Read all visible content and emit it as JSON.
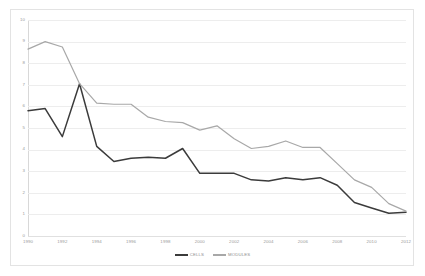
{
  "chart_data": {
    "type": "line",
    "title": "",
    "xlabel": "",
    "ylabel": "",
    "xlim": [
      1990,
      2012
    ],
    "ylim": [
      0,
      10
    ],
    "grid": true,
    "legend_position": "bottom-center",
    "x": [
      1990,
      1991,
      1992,
      1993,
      1994,
      1995,
      1996,
      1997,
      1998,
      1999,
      2000,
      2001,
      2002,
      2003,
      2004,
      2005,
      2006,
      2007,
      2008,
      2009,
      2010,
      2011,
      2012
    ],
    "xticks": [
      "1990",
      "1992",
      "1994",
      "1996",
      "1998",
      "2000",
      "2002",
      "2004",
      "2006",
      "2008",
      "2010",
      "2012"
    ],
    "yticks": [
      "10",
      "9",
      "8",
      "7",
      "6",
      "5",
      "4",
      "3",
      "2",
      "1",
      "0"
    ],
    "series": [
      {
        "name": "CELLS",
        "color": "#3b3b3b",
        "values": [
          5.8,
          5.9,
          4.6,
          7.05,
          4.15,
          3.45,
          3.6,
          3.65,
          3.6,
          4.05,
          2.9,
          2.9,
          2.9,
          2.6,
          2.55,
          2.7,
          2.6,
          2.7,
          2.35,
          1.55,
          1.3,
          1.05,
          1.1
        ]
      },
      {
        "name": "MODULES",
        "color": "#a8a8a8",
        "values": [
          8.65,
          9.0,
          8.75,
          7.05,
          6.15,
          6.1,
          6.1,
          5.5,
          5.3,
          5.25,
          4.9,
          5.1,
          4.5,
          4.05,
          4.15,
          4.4,
          4.1,
          4.1,
          3.35,
          2.6,
          2.25,
          1.5,
          1.15
        ]
      }
    ]
  },
  "legend": {
    "entries": [
      {
        "label": "CELLS"
      },
      {
        "label": "MODULES"
      }
    ]
  }
}
